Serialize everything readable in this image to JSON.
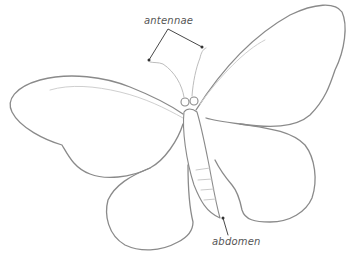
{
  "diagram": {
    "labels": {
      "antennae": "antennae",
      "abdomen": "abdomen"
    },
    "colors": {
      "stroke": "#8a8a8a",
      "stroke_light": "#c4c4c4",
      "leader": "#333333",
      "label_text": "#555555",
      "background": "#ffffff"
    }
  }
}
